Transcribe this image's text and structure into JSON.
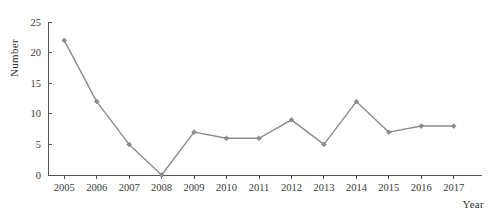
{
  "chart_data": {
    "type": "line",
    "title": "",
    "xlabel": "Year",
    "ylabel": "Number",
    "categories": [
      "2005",
      "2006",
      "2007",
      "2008",
      "2009",
      "2010",
      "2011",
      "2012",
      "2013",
      "2014",
      "2015",
      "2016",
      "2017"
    ],
    "values": [
      22,
      12,
      5,
      0,
      7,
      6,
      6,
      9,
      5,
      12,
      7,
      8,
      8
    ],
    "series": [
      {
        "name": "Number",
        "values": [
          22,
          12,
          5,
          0,
          7,
          6,
          6,
          9,
          5,
          12,
          7,
          8,
          8
        ]
      }
    ],
    "x": [
      2005,
      2006,
      2007,
      2008,
      2009,
      2010,
      2011,
      2012,
      2013,
      2014,
      2015,
      2016,
      2017
    ],
    "ylim": [
      0,
      25
    ],
    "yticks": [
      0,
      5,
      10,
      15,
      20,
      25
    ],
    "ytick_labels": [
      "0",
      "5",
      "10",
      "15",
      "20",
      "25"
    ],
    "xtick_labels": [
      "2005",
      "2006",
      "2007",
      "2008",
      "2009",
      "2010",
      "2011",
      "2012",
      "2013",
      "2014",
      "2015",
      "2016",
      "2017"
    ],
    "grid": false,
    "legend": false,
    "legend_position": "none",
    "line_color": "#8c8c8c",
    "marker_color": "#8c8c8c",
    "marker_shape": "diamond",
    "axis_color": "#555555",
    "background_color": "#ffffff"
  },
  "labels": {
    "y_axis_title": "Number",
    "x_axis_title": "Year"
  }
}
